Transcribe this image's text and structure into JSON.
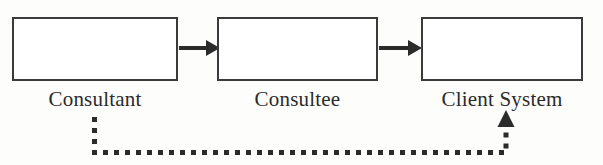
{
  "diagram": {
    "type": "flow-diagram",
    "background_color": "#fdfdfb",
    "stroke_color": "#2b2b2b",
    "box_border_color": "#3b3b3b",
    "nodes": [
      {
        "id": "consultant",
        "label": "Consultant"
      },
      {
        "id": "consultee",
        "label": "Consultee"
      },
      {
        "id": "client_system",
        "label": "Client System"
      }
    ],
    "connectors": [
      {
        "id": "consultant-to-consultee",
        "from": "consultant",
        "to": "consultee",
        "style": "solid",
        "arrow": "single",
        "direction": "right",
        "label": ""
      },
      {
        "id": "consultee-to-client-system",
        "from": "consultee",
        "to": "client_system",
        "style": "solid",
        "arrow": "single",
        "direction": "right",
        "label": ""
      },
      {
        "id": "consultant-to-client-system-indirect",
        "from": "consultant",
        "to": "client_system",
        "style": "dotted",
        "arrow": "single",
        "direction": "up",
        "label": ""
      }
    ]
  }
}
